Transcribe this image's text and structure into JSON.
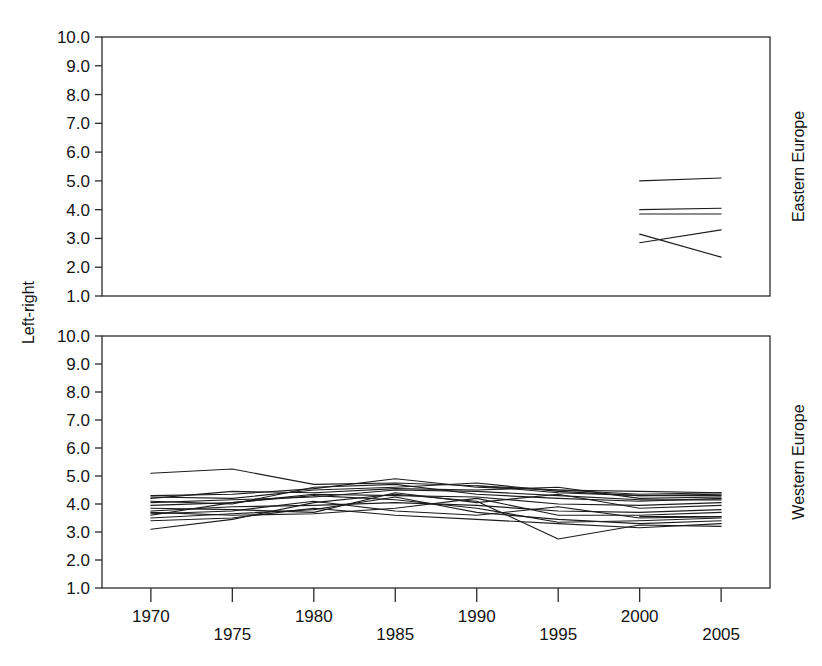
{
  "figure": {
    "width": 822,
    "height": 666,
    "background_color": "#ffffff",
    "line_color": "#1d1d1d",
    "axis_color": "#2b2b2b"
  },
  "axis": {
    "ylabel": "Left-right",
    "y_tick_labels": [
      "10.0",
      "9.0",
      "8.0",
      "7.0",
      "6.0",
      "5.0",
      "4.0",
      "3.0",
      "2.0",
      "1.0"
    ],
    "y_tick_values": [
      10,
      9,
      8,
      7,
      6,
      5,
      4,
      3,
      2,
      1
    ],
    "x_tick_labels": [
      "1970",
      "1975",
      "1980",
      "1985",
      "1990",
      "1995",
      "2000",
      "2005"
    ],
    "x_tick_values": [
      1970,
      1975,
      1980,
      1985,
      1990,
      1995,
      2000,
      2005
    ],
    "xlim": [
      1967,
      2008
    ],
    "ylim": [
      1.0,
      10.0
    ]
  },
  "panels": [
    {
      "id": "eastern",
      "strip_label": "Eastern Europe"
    },
    {
      "id": "western",
      "strip_label": "Western Europe"
    }
  ],
  "chart_data": {
    "type": "line",
    "title": "",
    "subtitle": "",
    "xlabel": "",
    "ylabel": "Left-right",
    "xlim": [
      1967,
      2008
    ],
    "ylim": [
      1.0,
      10.0
    ],
    "grid": false,
    "legend": "none",
    "facets": [
      {
        "name": "Eastern Europe",
        "strip_position": "right",
        "x": [
          1970,
          1975,
          1980,
          1985,
          1990,
          1995,
          2000,
          2005
        ],
        "series": [
          {
            "name": "east-party-1",
            "x": [
              2000,
              2005
            ],
            "values": [
              5.0,
              5.1
            ]
          },
          {
            "name": "east-party-2",
            "x": [
              2000,
              2005
            ],
            "values": [
              4.0,
              4.05
            ]
          },
          {
            "name": "east-party-3",
            "x": [
              2000,
              2005
            ],
            "values": [
              3.85,
              3.85
            ]
          },
          {
            "name": "east-party-4",
            "x": [
              2000,
              2005
            ],
            "values": [
              3.15,
              2.35
            ]
          },
          {
            "name": "east-party-5",
            "x": [
              2000,
              2005
            ],
            "values": [
              2.85,
              3.3
            ]
          }
        ]
      },
      {
        "name": "Western Europe",
        "strip_position": "right",
        "x": [
          1970,
          1975,
          1980,
          1985,
          1990,
          1995,
          2000,
          2005
        ],
        "series": [
          {
            "name": "west-party-1",
            "x": [
              1970,
              1975,
              1980,
              1985,
              1990,
              1995,
              2000,
              2005
            ],
            "values": [
              5.1,
              5.25,
              4.7,
              4.75,
              4.65,
              4.4,
              4.3,
              4.35
            ]
          },
          {
            "name": "west-party-2",
            "x": [
              1970,
              1975,
              1980,
              1985,
              1990,
              1995,
              2000,
              2005
            ],
            "values": [
              4.3,
              4.35,
              4.55,
              4.9,
              4.6,
              4.5,
              4.45,
              4.4
            ]
          },
          {
            "name": "west-party-3",
            "x": [
              1970,
              1975,
              1980,
              1985,
              1990,
              1995,
              2000,
              2005
            ],
            "values": [
              4.25,
              4.2,
              4.5,
              4.6,
              4.75,
              4.45,
              4.3,
              4.3
            ]
          },
          {
            "name": "west-party-4",
            "x": [
              1970,
              1975,
              1980,
              1985,
              1990,
              1995,
              2000,
              2005
            ],
            "values": [
              4.1,
              4.0,
              4.6,
              4.7,
              4.35,
              4.2,
              4.1,
              4.2
            ]
          },
          {
            "name": "west-party-5",
            "x": [
              1970,
              1975,
              1980,
              1985,
              1990,
              1995,
              2000,
              2005
            ],
            "values": [
              4.05,
              4.15,
              4.25,
              4.5,
              4.45,
              4.3,
              4.15,
              4.15
            ]
          },
          {
            "name": "west-party-6",
            "x": [
              1970,
              1975,
              1980,
              1985,
              1990,
              1995,
              2000,
              2005
            ],
            "values": [
              3.95,
              4.05,
              4.35,
              4.3,
              4.25,
              4.0,
              3.95,
              4.05
            ]
          },
          {
            "name": "west-party-7",
            "x": [
              1970,
              1975,
              1980,
              1985,
              1990,
              1995,
              2000,
              2005
            ],
            "values": [
              3.85,
              3.8,
              3.7,
              4.4,
              4.05,
              4.35,
              3.85,
              3.95
            ]
          },
          {
            "name": "west-party-8",
            "x": [
              1970,
              1975,
              1980,
              1985,
              1990,
              1995,
              2000,
              2005
            ],
            "values": [
              3.75,
              3.9,
              3.95,
              4.05,
              3.95,
              3.75,
              3.7,
              3.8
            ]
          },
          {
            "name": "west-party-9",
            "x": [
              1970,
              1975,
              1980,
              1985,
              1990,
              1995,
              2000,
              2005
            ],
            "values": [
              3.7,
              3.6,
              3.65,
              3.85,
              4.2,
              3.6,
              3.6,
              3.7
            ]
          },
          {
            "name": "west-party-10",
            "x": [
              1970,
              1975,
              1980,
              1985,
              1990,
              1995,
              2000,
              2005
            ],
            "values": [
              3.65,
              3.75,
              4.1,
              3.75,
              3.6,
              3.9,
              3.5,
              3.55
            ]
          },
          {
            "name": "west-party-11",
            "x": [
              1970,
              1975,
              1980,
              1985,
              1990,
              1995,
              2000,
              2005
            ],
            "values": [
              3.6,
              4.05,
              4.3,
              4.15,
              3.85,
              3.35,
              3.4,
              3.5
            ]
          },
          {
            "name": "west-party-12",
            "x": [
              1970,
              1975,
              1980,
              1985,
              1990,
              1995,
              2000,
              2005
            ],
            "values": [
              3.5,
              3.65,
              3.8,
              4.25,
              3.7,
              3.45,
              3.3,
              3.4
            ]
          },
          {
            "name": "west-party-13",
            "x": [
              1970,
              1975,
              1980,
              1985,
              1990,
              1995,
              2000,
              2005
            ],
            "values": [
              3.4,
              3.5,
              3.85,
              3.6,
              3.45,
              3.3,
              3.15,
              3.3
            ]
          },
          {
            "name": "west-party-14",
            "x": [
              1970,
              1975,
              1980,
              1985,
              1990,
              1995,
              2000,
              2005
            ],
            "values": [
              3.1,
              3.45,
              4.05,
              4.35,
              4.1,
              2.75,
              3.25,
              3.2
            ]
          },
          {
            "name": "west-party-15",
            "x": [
              1970,
              1975,
              1980,
              1985,
              1990,
              1995,
              2000,
              2005
            ],
            "values": [
              4.2,
              4.45,
              4.4,
              4.55,
              4.5,
              4.6,
              4.2,
              4.25
            ]
          },
          {
            "name": "west-party-16",
            "x": [
              1990,
              1995,
              2000,
              2005
            ],
            "values": [
              4.65,
              4.5,
              4.35,
              4.4
            ]
          },
          {
            "name": "west-party-17",
            "x": [
              2000,
              2005
            ],
            "values": [
              3.55,
              3.55
            ]
          }
        ]
      }
    ]
  }
}
